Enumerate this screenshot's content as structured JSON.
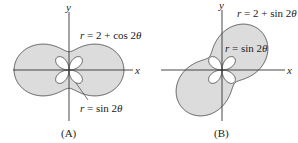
{
  "panels": [
    {
      "id": "A",
      "caption": "(A)",
      "axis_x_label": "x",
      "axis_y_label": "y",
      "outer_curve": {
        "label": "r = 2 + cos 2θ",
        "r_prefix": "r",
        "r_rest": " = 2 + cos 2",
        "theta": "θ"
      },
      "inner_curve": {
        "label": "r = sin 2θ",
        "r_prefix": "r",
        "r_rest": " = sin 2",
        "theta": "θ"
      }
    },
    {
      "id": "B",
      "caption": "(B)",
      "axis_x_label": "x",
      "axis_y_label": "y",
      "outer_curve": {
        "label": "r = 2 + sin 2θ",
        "r_prefix": "r",
        "r_rest": " = 2 + sin 2",
        "theta": "θ"
      },
      "inner_curve": {
        "label": "r = sin 2θ",
        "r_prefix": "r",
        "r_rest": " = sin 2",
        "theta": "θ"
      }
    }
  ],
  "colors": {
    "fill": "#dcdcdc",
    "stroke": "#444444",
    "axis": "#333333"
  }
}
